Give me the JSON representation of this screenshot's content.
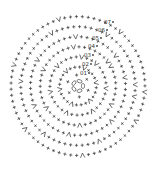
{
  "diagram": {
    "type": "crochet-stitch-chart",
    "center": [
      78,
      86
    ],
    "colors": {
      "stitch": "#3a3a3a",
      "background": "#ffffff"
    },
    "legend_symbols": {
      "sc": "+",
      "inc": "V",
      "ch": "0",
      "sl_st": "•"
    },
    "rounds": [
      {
        "label": "01",
        "radius": 9,
        "stitches": 6,
        "increases": 0
      },
      {
        "label": "02",
        "radius": 17,
        "stitches": 12,
        "increases": 6
      },
      {
        "label": "03",
        "radius": 26,
        "stitches": 18,
        "increases": 6
      },
      {
        "label": "04",
        "radius": 35,
        "stitches": 24,
        "increases": 6
      },
      {
        "label": "05",
        "radius": 44,
        "stitches": 30,
        "increases": 6
      },
      {
        "label": "06",
        "radius": 53,
        "stitches": 36,
        "increases": 6
      },
      {
        "label": "07",
        "radius": 62,
        "stitches": 42,
        "increases": 6
      }
    ],
    "labels": [
      {
        "text": "01",
        "x": 80,
        "y": 75
      },
      {
        "text": "02",
        "x": 82,
        "y": 66
      },
      {
        "text": "03",
        "x": 84,
        "y": 57
      },
      {
        "text": "04",
        "x": 88,
        "y": 48
      },
      {
        "text": "05",
        "x": 92,
        "y": 40
      },
      {
        "text": "06",
        "x": 98,
        "y": 32
      },
      {
        "text": "07",
        "x": 104,
        "y": 24
      }
    ]
  }
}
